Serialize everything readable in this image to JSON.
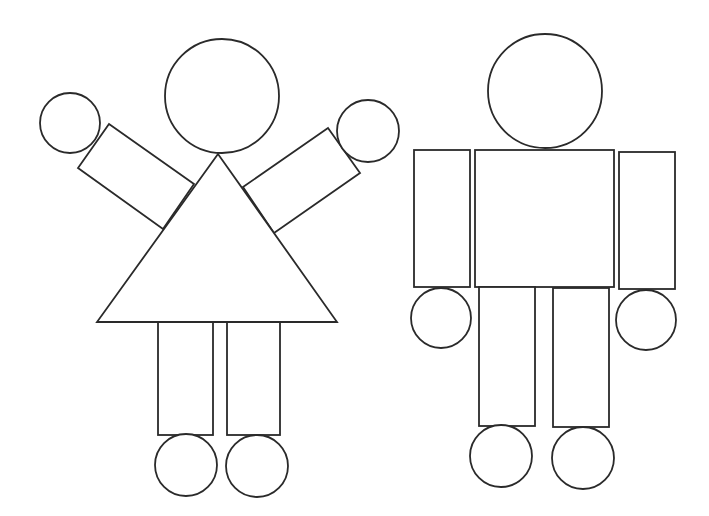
{
  "illustration": {
    "description": "Two figures made of simple geometric shapes",
    "stroke_color": "#2a2a2a",
    "background_color": "#ffffff",
    "figures": [
      {
        "name": "girl-figure",
        "head": {
          "cx": 222,
          "cy": 96,
          "r": 57
        },
        "body_triangle": {
          "points": "218,154 97,322 337,322"
        },
        "left_arm": {
          "points": "109,124 194,184 163,229 78,168"
        },
        "right_arm": {
          "points": "328,128 360,173 274,233 243,187"
        },
        "left_hand": {
          "cx": 70,
          "cy": 123,
          "r": 30
        },
        "right_hand": {
          "cx": 368,
          "cy": 131,
          "r": 31
        },
        "left_leg": {
          "x": 158,
          "y": 322,
          "w": 55,
          "h": 113
        },
        "right_leg": {
          "x": 227,
          "y": 322,
          "w": 53,
          "h": 113
        },
        "left_foot": {
          "cx": 186,
          "cy": 465,
          "r": 31
        },
        "right_foot": {
          "cx": 257,
          "cy": 466,
          "r": 31
        }
      },
      {
        "name": "boy-figure",
        "head": {
          "cx": 545,
          "cy": 91,
          "r": 57
        },
        "body_rect": {
          "x": 475,
          "y": 150,
          "w": 139,
          "h": 137
        },
        "left_arm": {
          "x": 414,
          "y": 150,
          "w": 56,
          "h": 137
        },
        "right_arm": {
          "x": 619,
          "y": 152,
          "w": 56,
          "h": 137
        },
        "left_hand": {
          "cx": 441,
          "cy": 318,
          "r": 30
        },
        "right_hand": {
          "cx": 646,
          "cy": 320,
          "r": 30
        },
        "left_leg": {
          "x": 479,
          "y": 287,
          "w": 56,
          "h": 139
        },
        "right_leg": {
          "x": 553,
          "y": 288,
          "w": 56,
          "h": 139
        },
        "left_foot": {
          "cx": 501,
          "cy": 456,
          "r": 31
        },
        "right_foot": {
          "cx": 583,
          "cy": 458,
          "r": 31
        }
      }
    ]
  }
}
